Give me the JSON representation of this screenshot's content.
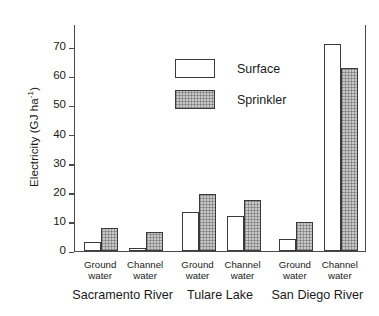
{
  "chart_data": {
    "type": "bar",
    "title": "",
    "xlabel": "",
    "ylabel": "Electricity (GJ ha",
    "ylabel_sup": "-1",
    "ylabel_tail": ")",
    "ylim": [
      0,
      78
    ],
    "yticks": [
      0,
      10,
      20,
      30,
      40,
      50,
      60,
      70
    ],
    "ytick_labels": [
      "0",
      "10",
      "20",
      "30",
      "40",
      "50",
      "60",
      "70"
    ],
    "grid": false,
    "legend_position": "upper-left-inside",
    "legend": [
      "Surface",
      "Sprinkler"
    ],
    "groups": [
      "Sacramento River",
      "Tulare Lake",
      "San Diego River"
    ],
    "categories": [
      "Ground water",
      "Channel water",
      "Ground water",
      "Channel water",
      "Ground water",
      "Channel water"
    ],
    "subcat_line1": [
      "Ground",
      "Channel",
      "Ground",
      "Channel",
      "Ground",
      "Channel"
    ],
    "subcat_line2": [
      "water",
      "water",
      "water",
      "water",
      "water",
      "water"
    ],
    "series": [
      {
        "name": "Surface",
        "values": [
          3.0,
          1.2,
          13.5,
          12.0,
          4.0,
          71.0
        ]
      },
      {
        "name": "Sprinkler",
        "values": [
          7.8,
          6.7,
          19.5,
          17.5,
          10.0,
          63.0
        ]
      }
    ]
  },
  "axis": {
    "ylabel_text": "Electricity (GJ ha",
    "ylabel_sup": "-1",
    "ylabel_close": ")"
  }
}
